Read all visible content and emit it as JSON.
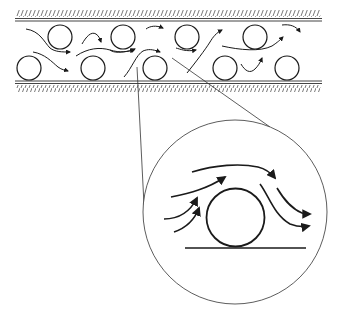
{
  "diagram": {
    "colors": {
      "stroke": "#1a1a1a",
      "thin_stroke": "#333333",
      "hatch": "#555555",
      "background": "#ffffff"
    },
    "channel": {
      "top_wall_y": 20,
      "bottom_wall_y": 82,
      "x_start": 15,
      "x_end": 322
    },
    "particles": [
      {
        "cx": 60,
        "cy": 37,
        "r": 12
      },
      {
        "cx": 123,
        "cy": 37,
        "r": 12
      },
      {
        "cx": 187,
        "cy": 37,
        "r": 12
      },
      {
        "cx": 255,
        "cy": 37,
        "r": 12
      },
      {
        "cx": 29,
        "cy": 68,
        "r": 12
      },
      {
        "cx": 93,
        "cy": 68,
        "r": 12
      },
      {
        "cx": 155,
        "cy": 68,
        "r": 12
      },
      {
        "cx": 225,
        "cy": 68,
        "r": 12
      },
      {
        "cx": 287,
        "cy": 68,
        "r": 12
      }
    ],
    "inset": {
      "cx": 235,
      "cy": 212,
      "r": 92,
      "particle": {
        "cx": 235,
        "cy": 218,
        "r": 29
      },
      "ground_y": 248
    }
  }
}
